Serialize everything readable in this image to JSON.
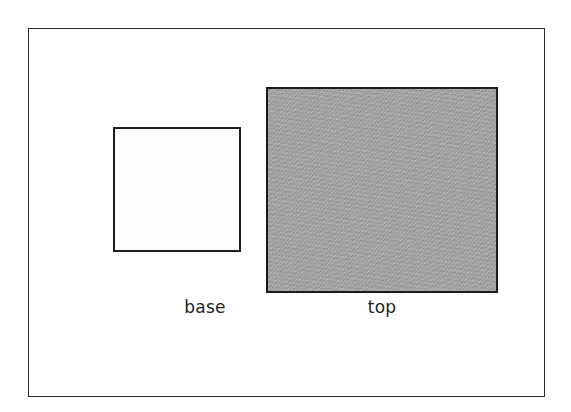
{
  "figure": {
    "background_color": "#ffffff",
    "frame": {
      "name": "outer-border",
      "border_color": "#2b2b2b"
    },
    "shapes": [
      {
        "id": "base",
        "label": "base",
        "fill": "unshaded",
        "fill_color": "#fdfdfd",
        "border_color": "#1e1e1e"
      },
      {
        "id": "top",
        "label": "top",
        "fill": "shaded",
        "fill_color": "#a8a8a8",
        "border_color": "#1a1a1a"
      }
    ]
  }
}
